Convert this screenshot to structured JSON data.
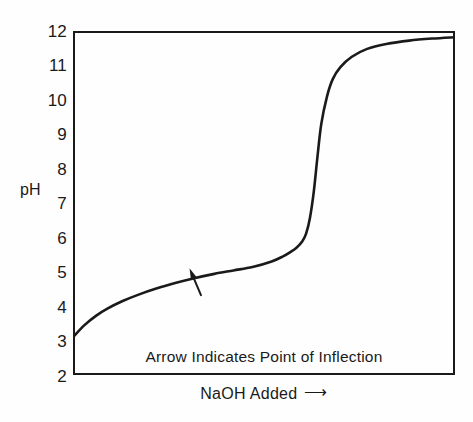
{
  "chart_data": {
    "type": "line",
    "title": "",
    "subtitle": "",
    "xlabel": "NaOH Added",
    "ylabel": "pH",
    "xlabel_arrow": "⟶",
    "grid": false,
    "legend": "none",
    "xlim": [
      0,
      100
    ],
    "ylim": [
      2,
      12
    ],
    "y_ticks": [
      12,
      11,
      10,
      9,
      8,
      7,
      6,
      5,
      4,
      3,
      2
    ],
    "y_tick_labels": [
      "12",
      "11",
      "10",
      "9",
      "8",
      "7",
      "6",
      "5",
      "4",
      "3",
      "2"
    ],
    "x_ticks": [],
    "x_tick_labels": [],
    "series": [
      {
        "name": "Titration curve",
        "color": "#1a1a1a",
        "x": [
          0,
          3,
          6,
          9,
          13,
          17,
          22,
          27,
          32,
          37,
          42,
          47,
          52,
          55,
          57,
          58.5,
          60,
          61,
          62,
          63,
          64,
          65,
          66.5,
          68,
          70,
          73,
          77,
          82,
          88,
          94,
          100
        ],
        "y": [
          3.1,
          3.45,
          3.72,
          3.93,
          4.15,
          4.33,
          4.52,
          4.68,
          4.82,
          4.94,
          5.04,
          5.14,
          5.3,
          5.45,
          5.58,
          5.7,
          5.88,
          6.1,
          6.55,
          7.3,
          8.35,
          9.3,
          10.1,
          10.6,
          10.95,
          11.25,
          11.48,
          11.62,
          11.72,
          11.78,
          11.82
        ]
      }
    ],
    "annotations": [
      {
        "name": "inflection-arrow",
        "kind": "arrow",
        "note": "Arrow Indicates Point of Inflection",
        "tip_x": 30.5,
        "tip_y": 5.1,
        "tail_x": 33.5,
        "tail_y": 4.32
      },
      {
        "name": "inflection-caption",
        "kind": "text",
        "text": "Arrow Indicates Point of Inflection"
      }
    ]
  },
  "axes": {
    "y_title": "pH",
    "x_title": "NaOH Added",
    "x_title_arrow": "⟶",
    "y_tick_labels": [
      "12",
      "11",
      "10",
      "9",
      "8",
      "7",
      "6",
      "5",
      "4",
      "3",
      "2"
    ]
  },
  "caption": {
    "inflection_note": "Arrow Indicates Point of Inflection"
  },
  "colors": {
    "curve": "#1a1a1a",
    "frame": "#1a1a1a",
    "text": "#1a1a1a",
    "background": "#fefefe"
  }
}
